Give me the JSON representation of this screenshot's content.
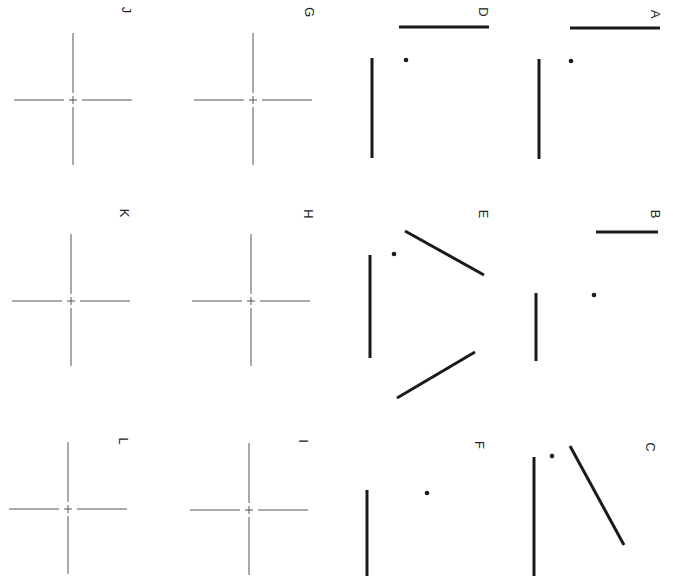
{
  "figure": {
    "orientation": "rotated 90 degrees clockwise",
    "stroke_color": "#1a1a1a",
    "cross_color": "#555555",
    "background": "#ffffff"
  },
  "panels": [
    {
      "id": "A",
      "label": "A",
      "type": "lines-and-dot",
      "label_pos": [
        655,
        14
      ],
      "lines": [
        [
          570,
          28,
          660,
          28
        ],
        [
          539,
          59,
          539,
          159
        ]
      ],
      "dot": [
        571,
        61
      ]
    },
    {
      "id": "B",
      "label": "B",
      "type": "lines-and-dot",
      "label_pos": [
        655,
        214
      ],
      "lines": [
        [
          596,
          232,
          658,
          232
        ],
        [
          536,
          293,
          536,
          361
        ]
      ],
      "dot": [
        594,
        295
      ]
    },
    {
      "id": "C",
      "label": "C",
      "type": "lines-and-dot",
      "label_pos": [
        650,
        447
      ],
      "lines": [
        [
          570,
          446,
          624,
          545
        ],
        [
          534,
          457,
          534,
          576
        ]
      ],
      "dot": [
        552,
        456
      ]
    },
    {
      "id": "D",
      "label": "D",
      "type": "lines-and-dot",
      "label_pos": [
        483,
        12
      ],
      "lines": [
        [
          399,
          27,
          489,
          27
        ],
        [
          372,
          58,
          372,
          158
        ]
      ],
      "dot": [
        406,
        60
      ]
    },
    {
      "id": "E",
      "label": "E",
      "type": "lines-and-dot",
      "label_pos": [
        483,
        214
      ],
      "lines": [
        [
          405,
          231,
          484,
          275
        ],
        [
          370,
          255,
          370,
          358
        ],
        [
          397,
          398,
          475,
          352
        ]
      ],
      "dot": [
        394,
        254
      ]
    },
    {
      "id": "F",
      "label": "F",
      "type": "lines-and-dot",
      "label_pos": [
        479,
        445
      ],
      "lines": [
        [
          367,
          490,
          367,
          576
        ]
      ],
      "dot": [
        427,
        493
      ]
    },
    {
      "id": "G",
      "label": "G",
      "type": "fixation-cross",
      "label_pos": [
        309,
        12
      ],
      "center": [
        253,
        100
      ]
    },
    {
      "id": "H",
      "label": "H",
      "type": "fixation-cross",
      "label_pos": [
        308,
        214
      ],
      "center": [
        251,
        301
      ]
    },
    {
      "id": "I",
      "label": "I",
      "type": "fixation-cross",
      "label_pos": [
        303,
        441
      ],
      "center": [
        249,
        510
      ]
    },
    {
      "id": "J",
      "label": "J",
      "type": "fixation-cross",
      "label_pos": [
        126,
        10
      ],
      "center": [
        73,
        100
      ]
    },
    {
      "id": "K",
      "label": "K",
      "type": "fixation-cross",
      "label_pos": [
        124,
        213
      ],
      "center": [
        71,
        301
      ]
    },
    {
      "id": "L",
      "label": "L",
      "type": "fixation-cross",
      "label_pos": [
        123,
        441
      ],
      "center": [
        68,
        509
      ]
    }
  ]
}
